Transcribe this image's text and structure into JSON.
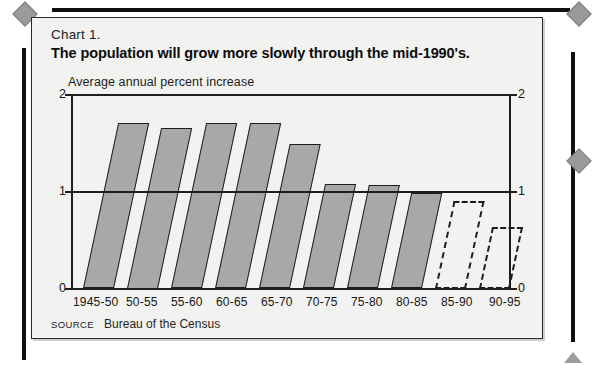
{
  "card": {
    "chart_number": "Chart 1.",
    "title": "The population will grow more slowly through the mid-1990's.",
    "axis_caption": "Average annual percent increase",
    "source_label": "SOURCE",
    "source_text": "Bureau of the Census"
  },
  "chart_data": {
    "type": "bar",
    "title": "The population will grow more slowly through the mid-1990's.",
    "subtitle": "Chart 1.",
    "xlabel": "",
    "ylabel": "Average annual percent increase",
    "ylim": [
      0,
      2
    ],
    "yticks": [
      0,
      1,
      2
    ],
    "ytick_labels": [
      "0",
      "1",
      "2"
    ],
    "ytick_labels_right": [
      "0",
      "1",
      "2"
    ],
    "grid": "horizontal gridline at y = 1 only",
    "legend": "none",
    "bar_style": "skewed parallelogram bars; solid gray = actual, dashed outline = projected",
    "categories": [
      "1945-50",
      "50-55",
      "55-60",
      "60-65",
      "65-70",
      "70-75",
      "75-80",
      "80-85",
      "85-90",
      "90-95"
    ],
    "values": [
      1.72,
      1.67,
      1.72,
      1.72,
      1.5,
      1.08,
      1.07,
      0.99,
      0.91,
      0.64
    ],
    "series": [
      {
        "name": "Average annual percent increase",
        "values": [
          1.72,
          1.67,
          1.72,
          1.72,
          1.5,
          1.08,
          1.07,
          0.99,
          0.91,
          0.64
        ],
        "projected": [
          false,
          false,
          false,
          false,
          false,
          false,
          false,
          false,
          true,
          true
        ]
      }
    ],
    "colors": {
      "bar_fill": "#a8a8a8",
      "bar_outline": "#1d1d1d",
      "projected_fill": "none",
      "projected_outline": "#1d1d1d",
      "plot_background": "#f2f2f0"
    },
    "annotations": [
      "SOURCE Bureau of the Census"
    ]
  }
}
